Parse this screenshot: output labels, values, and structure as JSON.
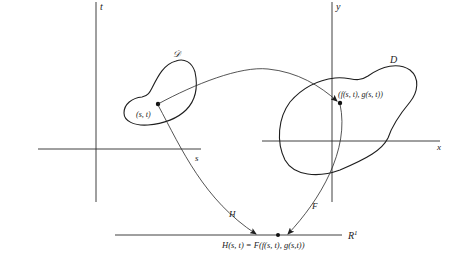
{
  "figure": {
    "left_plane": {
      "vertical_axis_label": "t",
      "horizontal_axis_label": "s",
      "region_label": "𝒟",
      "point_label": "(s, t)"
    },
    "right_plane": {
      "vertical_axis_label": "y",
      "horizontal_axis_label": "x",
      "region_label": "D",
      "point_label": "(f(s, t), g(s, t))"
    },
    "real_line": {
      "label": "R",
      "label_superscript": "1",
      "point_label": "H(s, t) = F(f(s, t), g(s,t))"
    },
    "mappings": {
      "H": "H",
      "F": "F"
    },
    "colors": {
      "ink": "#1e1e1e",
      "background": "#ffffff"
    }
  }
}
